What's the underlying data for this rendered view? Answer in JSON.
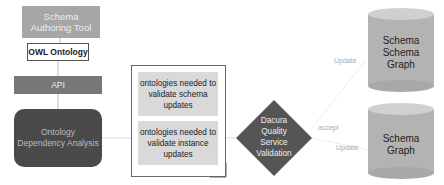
{
  "diagram": {
    "nodes": {
      "authoring_tool": {
        "label": "Schema Authoring Tool",
        "line1": "Schema",
        "line2": "Authoring Tool",
        "color": "#a6a6a6"
      },
      "owl_ontology": {
        "label": "OWL Ontology"
      },
      "api": {
        "label": "API",
        "color": "#777777"
      },
      "dependency_analysis": {
        "line1": "Ontology",
        "line2": "Dependency Analysis",
        "color": "#4a4a4a"
      },
      "document": {
        "items": [
          {
            "text": "ontologies needed to validate schema updates"
          },
          {
            "text": "ontologies needed to validate instance updates"
          }
        ]
      },
      "validation": {
        "line1": "Dacura",
        "line2": "Quality",
        "line3": "Service",
        "line4": "Validation",
        "color": "#555555"
      },
      "schema_schema_graph": {
        "line1": "Schema",
        "line2": "Schema",
        "line3": "Graph"
      },
      "schema_graph": {
        "line1": "Schema",
        "line2": "Graph"
      }
    },
    "edges": {
      "update_top": "Update",
      "accept": "accept",
      "update_bottom": "Update"
    }
  }
}
